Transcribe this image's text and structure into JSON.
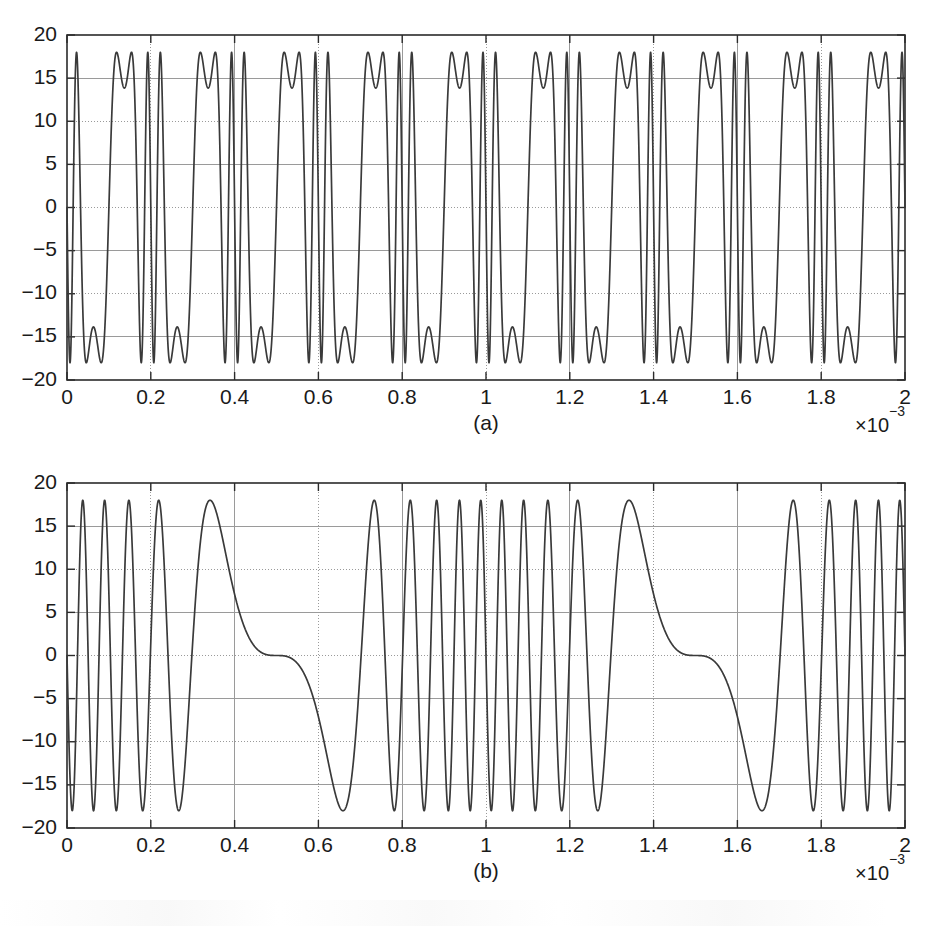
{
  "figure": {
    "background_color": "#ffffff",
    "line_color": "#3a3a3a",
    "grid_color": "#9a9a9a",
    "axis_color": "#2b2b2b"
  },
  "panels": [
    {
      "caption": "(a)",
      "exponent_prefix": "×10",
      "exponent_power": "−3"
    },
    {
      "caption": "(b)",
      "exponent_prefix": "×10",
      "exponent_power": "−3"
    }
  ],
  "chart_data": [
    {
      "type": "line",
      "title": "",
      "subtitle": "",
      "panel": "(a)",
      "xlabel": "",
      "ylabel": "",
      "xlim": [
        0,
        0.002
      ],
      "ylim": [
        -20,
        20
      ],
      "x_tick_labels": [
        "0",
        "0.2",
        "0.4",
        "0.6",
        "0.8",
        "1",
        "1.2",
        "1.4",
        "1.6",
        "1.8",
        "2"
      ],
      "x_tick_values": [
        0,
        0.0002,
        0.0004,
        0.0006,
        0.0008,
        0.001,
        0.0012,
        0.0014,
        0.0016,
        0.0018,
        0.002
      ],
      "y_tick_labels": [
        "−20",
        "−15",
        "−10",
        "−5",
        "0",
        "5",
        "10",
        "15",
        "20"
      ],
      "y_tick_values": [
        -20,
        -15,
        -10,
        -5,
        0,
        5,
        10,
        15,
        20
      ],
      "x_axis_multiplier": "×10−3",
      "grid": true,
      "legend": "none",
      "annotations": [
        "(a)"
      ],
      "series": [
        {
          "name": "fm-signal-a",
          "color": "#3a3a3a",
          "amplitude": 18,
          "carrier_frequency_hz": 10000,
          "modulation_index": 5,
          "modulator_frequency_hz": 5000,
          "phase_offset_rad": 1.5707963,
          "formula": "18*cos(2*pi*10000*t + 5*sin(2*pi*5000*t) + pi/2)",
          "samples_x": [
            0,
            0.0002,
            0.0004,
            0.0006,
            0.0008,
            0.001,
            0.0012,
            0.0014,
            0.0016,
            0.0018,
            0.002
          ],
          "samples_y": [
            18,
            -18,
            -18,
            18,
            18,
            -18,
            -18,
            18,
            18,
            -18,
            -18
          ]
        }
      ]
    },
    {
      "type": "line",
      "title": "",
      "subtitle": "",
      "panel": "(b)",
      "xlabel": "",
      "ylabel": "",
      "xlim": [
        0,
        0.002
      ],
      "ylim": [
        -20,
        20
      ],
      "x_tick_labels": [
        "0",
        "0.2",
        "0.4",
        "0.6",
        "0.8",
        "1",
        "1.2",
        "1.4",
        "1.6",
        "1.8",
        "2"
      ],
      "x_tick_values": [
        0,
        0.0002,
        0.0004,
        0.0006,
        0.0008,
        0.001,
        0.0012,
        0.0014,
        0.0016,
        0.0018,
        0.002
      ],
      "y_tick_labels": [
        "−20",
        "−15",
        "−10",
        "−5",
        "0",
        "5",
        "10",
        "15",
        "20"
      ],
      "y_tick_values": [
        -20,
        -15,
        -10,
        -5,
        0,
        5,
        10,
        15,
        20
      ],
      "x_axis_multiplier": "×10−3",
      "grid": true,
      "legend": "none",
      "annotations": [
        "(b)"
      ],
      "series": [
        {
          "name": "fm-signal-b",
          "color": "#3a3a3a",
          "amplitude": 18,
          "carrier_frequency_hz": 10000,
          "modulation_index": 10,
          "modulator_frequency_hz": 1000,
          "phase_offset_rad": 1.5707963,
          "formula": "18*cos(2*pi*10000*t + 10*sin(2*pi*1000*t) + pi/2)",
          "samples_x": [
            0,
            0.0002,
            0.0004,
            0.0006,
            0.0008,
            0.001,
            0.0012,
            0.0014,
            0.0016,
            0.0018,
            0.002
          ],
          "samples_y": [
            18,
            18,
            -5,
            -13,
            15,
            18,
            -16,
            -9,
            12,
            17,
            18
          ]
        }
      ]
    }
  ]
}
